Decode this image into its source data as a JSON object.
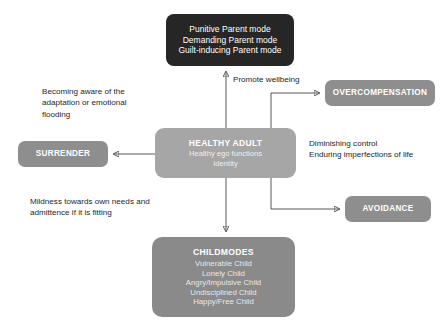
{
  "diagram": {
    "nodes": {
      "parent_modes": {
        "lines": [
          "Punitive Parent mode",
          "Demanding Parent mode",
          "Guilt-inducing Parent mode"
        ],
        "color": "#262626"
      },
      "healthy_adult": {
        "title": "HEALTHY ADULT",
        "lines": [
          "Healthy ego functions",
          "Identity"
        ],
        "color": "#a6a6a6"
      },
      "child_modes": {
        "title": "CHILDMODES",
        "lines": [
          "Vulnerable Child",
          "Lonely Child",
          "Angry/Impulsive Child",
          "Undisciplined Child",
          "Happy/Free Child"
        ],
        "color": "#8a8a8a"
      },
      "surrender": {
        "label": "SURRENDER",
        "color": "#8e8e8e"
      },
      "overcompensation": {
        "label": "OVERCOMPENSATION",
        "color": "#8e8e8e"
      },
      "avoidance": {
        "label": "AVOIDANCE",
        "color": "#8e8e8e"
      }
    },
    "annotations": {
      "becoming_aware": "Becoming aware of the\nadaptation or emotional\nflooding",
      "mildness": "Mildness towards own needs and\nadmittence if it is fitting",
      "promote_wellbeing": "Promote wellbeing",
      "diminishing_control": "Diminishing control\nEnduring imperfections of life"
    },
    "connector_color": "#595959",
    "background_color": "#ffffff"
  }
}
